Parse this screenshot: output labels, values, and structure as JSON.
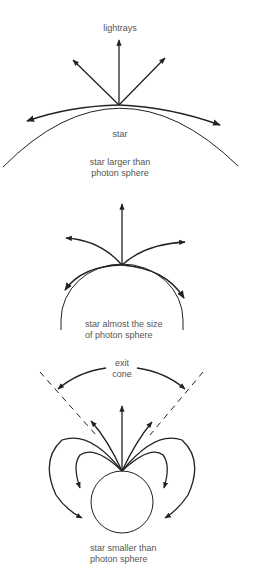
{
  "figure": {
    "panels": [
      {
        "id": "large-star",
        "labels": {
          "rays": "lightrays",
          "star": "star",
          "caption_line1": "star larger than",
          "caption_line2": "photon sphere"
        }
      },
      {
        "id": "near-photon-sphere",
        "labels": {
          "caption_line1": "star almost the size",
          "caption_line2": "of photon sphere"
        }
      },
      {
        "id": "small-star",
        "labels": {
          "cone_line1": "exit",
          "cone_line2": "cone",
          "caption_line1": "star smaller than",
          "caption_line2": "photon sphere"
        }
      }
    ],
    "colors": {
      "stroke": "#222222",
      "text": "#555555",
      "background": "#ffffff"
    }
  }
}
